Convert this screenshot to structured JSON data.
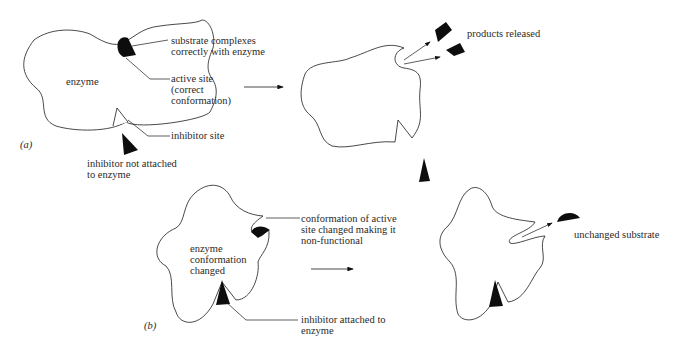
{
  "panel_a": {
    "label": "(a)",
    "enzyme_label": "enzyme",
    "callouts": {
      "substrate": [
        "substrate complexes",
        "correctly with enzyme"
      ],
      "active_site": [
        "active site",
        "(correct",
        "conformation)"
      ],
      "inhibitor_site": "inhibitor site",
      "inhibitor_free": [
        "inhibitor not attached",
        "to enzyme"
      ],
      "products": "products released"
    }
  },
  "panel_b": {
    "label": "(b)",
    "enzyme_label": [
      "enzyme",
      "conformation",
      "changed"
    ],
    "callouts": {
      "active_site_changed": [
        "conformation of active",
        "site changed making it",
        "non-functional"
      ],
      "inhibitor_attached": [
        "inhibitor attached to",
        "enzyme"
      ],
      "unchanged_substrate": "unchanged substrate"
    }
  },
  "colors": {
    "ink": "#1a1a1a",
    "fill": "#0d0d0d",
    "background": "#ffffff"
  }
}
